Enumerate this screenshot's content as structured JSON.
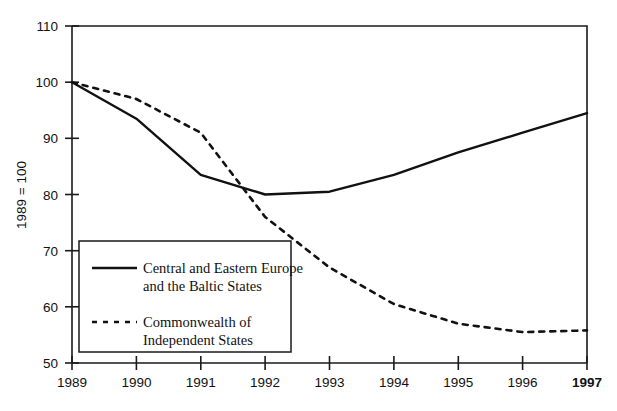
{
  "chart_data": {
    "type": "line",
    "title": "",
    "xlabel": "",
    "ylabel": "1989 = 100",
    "x": [
      1989,
      1990,
      1991,
      1992,
      1993,
      1994,
      1995,
      1996,
      1997
    ],
    "xtick_labels": [
      "1989",
      "1990",
      "1991",
      "1992",
      "1993",
      "1994",
      "1995",
      "1996",
      "1997"
    ],
    "ytick_labels": [
      "110",
      "100",
      "90",
      "80",
      "70",
      "60",
      "50"
    ],
    "yticks": [
      110,
      100,
      90,
      80,
      70,
      60,
      50
    ],
    "ylim": [
      50,
      110
    ],
    "xlim": [
      1989,
      1997
    ],
    "grid": false,
    "legend_position": "lower-left-inside",
    "series": [
      {
        "name": "Central and Eastern Europe and the Baltic States",
        "legend_line1": "Central and Eastern Europe",
        "legend_line2": "and the Baltic States",
        "style": "solid",
        "color": "#111111",
        "values": [
          100,
          93.5,
          83.5,
          80,
          80.5,
          83.5,
          87.5,
          91,
          94.5
        ]
      },
      {
        "name": "Commonwealth of Independent States",
        "legend_line1": "Commonwealth of",
        "legend_line2": "Independent States",
        "style": "dashed",
        "color": "#111111",
        "values": [
          100,
          97,
          91,
          76,
          67,
          60.5,
          57,
          55.5,
          55.8
        ]
      }
    ],
    "emphasis": {
      "bold_xtick": "1997"
    }
  }
}
